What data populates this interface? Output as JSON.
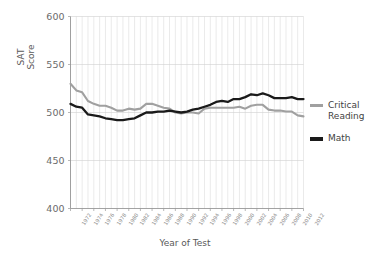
{
  "chart_data": {
    "type": "line",
    "title": "",
    "xlabel": "Year of Test",
    "ylabel": "SAT\nScore",
    "ylim": [
      400,
      600
    ],
    "yticks": [
      400,
      450,
      500,
      550,
      600
    ],
    "xlim": [
      1972,
      2012
    ],
    "grid": true,
    "grid_x_interval": 1,
    "legend_position": "right",
    "x": [
      1972,
      1973,
      1974,
      1975,
      1976,
      1977,
      1978,
      1979,
      1980,
      1981,
      1982,
      1983,
      1984,
      1985,
      1986,
      1987,
      1988,
      1989,
      1990,
      1991,
      1992,
      1993,
      1994,
      1995,
      1996,
      1997,
      1998,
      1999,
      2000,
      2001,
      2002,
      2003,
      2004,
      2005,
      2006,
      2007,
      2008,
      2009,
      2010,
      2011,
      2012
    ],
    "xticks": [
      "1972",
      "1974",
      "1976",
      "1978",
      "1980",
      "1982",
      "1984",
      "1986",
      "1988",
      "1990",
      "1992",
      "1994",
      "1996",
      "1998",
      "2000",
      "2002",
      "2004",
      "2006",
      "2008",
      "2010",
      "2012"
    ],
    "series": [
      {
        "name": "Critical Reading",
        "color": "#a0a0a0",
        "values": [
          530,
          523,
          521,
          512,
          509,
          507,
          507,
          505,
          502,
          502,
          504,
          503,
          504,
          509,
          509,
          507,
          505,
          504,
          500,
          499,
          500,
          500,
          499,
          504,
          505,
          505,
          505,
          505,
          505,
          506,
          504,
          507,
          508,
          508,
          503,
          502,
          502,
          501,
          501,
          497,
          496
        ]
      },
      {
        "name": "Math",
        "color": "#1a1a1a",
        "values": [
          509,
          506,
          505,
          498,
          497,
          496,
          494,
          493,
          492,
          492,
          493,
          494,
          497,
          500,
          500,
          501,
          501,
          502,
          501,
          500,
          501,
          503,
          504,
          506,
          508,
          511,
          512,
          511,
          514,
          514,
          516,
          519,
          518,
          520,
          518,
          515,
          515,
          515,
          516,
          514,
          514
        ]
      }
    ]
  },
  "legend": {
    "items": [
      {
        "label": "Critical\nReading",
        "color": "#a0a0a0"
      },
      {
        "label": "Math",
        "color": "#1a1a1a"
      }
    ]
  }
}
